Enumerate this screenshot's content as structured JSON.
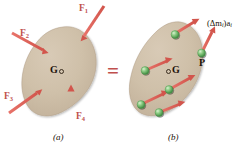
{
  "figure": {
    "equals_symbol": "=",
    "colors": {
      "body_fill": "#cdbda6",
      "body_fill_light": "#d6c8b3",
      "body_edge": "#b5a48c",
      "arrow_red": "#e2625a",
      "arrow_red_dark": "#c94f46",
      "sphere_green": "#7dc87d",
      "sphere_green_dark": "#4f9e4f",
      "label_red": "#c0504d",
      "label_dark": "#1a1008",
      "background": "#ffffff"
    },
    "panels": [
      {
        "id": "panel-a",
        "caption": "(a)",
        "centroid_label": "G",
        "centroid_marker": "circle",
        "description": "Rigid body acted upon by four external forces",
        "forces": [
          {
            "name": "F1",
            "label": "F",
            "subscript": "1",
            "direction": "down-left"
          },
          {
            "name": "F2",
            "label": "F",
            "subscript": "2",
            "direction": "down-right"
          },
          {
            "name": "F3",
            "label": "F",
            "subscript": "3",
            "direction": "up-right"
          },
          {
            "name": "F4",
            "label": "F",
            "subscript": "4",
            "direction": "up"
          }
        ]
      },
      {
        "id": "panel-b",
        "caption": "(b)",
        "centroid_label": "G",
        "centroid_marker": "circle",
        "point_label": "P",
        "effective_force_label": "(Δm",
        "effective_force_sub1": "i",
        "effective_force_mid": ")a",
        "effective_force_sub2": "i",
        "description": "Same rigid body with effective forces of its particles",
        "particle_count": 6
      }
    ]
  }
}
